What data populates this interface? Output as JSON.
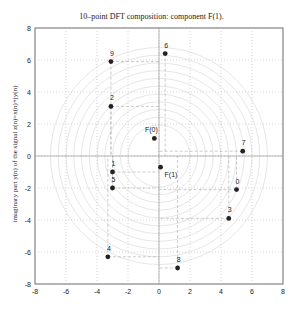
{
  "chart_data": {
    "type": "scatter",
    "title": "10–point DFT composition: component F(1).",
    "xlabel": "",
    "ylabel": "imaginary part y(n) of the signal z(n)=x(n)+jy(n)",
    "xlim": [
      -8,
      8
    ],
    "ylim": [
      -8,
      8
    ],
    "xticks": [
      -8,
      -6,
      -4,
      -2,
      0,
      2,
      4,
      6,
      8
    ],
    "yticks": [
      -8,
      -6,
      -4,
      -2,
      0,
      2,
      4,
      6,
      8
    ],
    "grid": true,
    "points": [
      {
        "label": "0",
        "x": 5.0,
        "y": -2.1
      },
      {
        "label": "1",
        "x": -3.0,
        "y": -1.0
      },
      {
        "label": "2",
        "x": -3.1,
        "y": 3.1
      },
      {
        "label": "3",
        "x": 4.5,
        "y": -3.9
      },
      {
        "label": "4",
        "x": -3.3,
        "y": -6.3
      },
      {
        "label": "5",
        "x": -3.0,
        "y": -2.0
      },
      {
        "label": "6",
        "x": 0.4,
        "y": 6.4
      },
      {
        "label": "7",
        "x": 5.4,
        "y": 0.3
      },
      {
        "label": "8",
        "x": 1.2,
        "y": -7.0
      },
      {
        "label": "9",
        "x": -3.1,
        "y": 5.9
      },
      {
        "label": "F(0)",
        "x": -0.3,
        "y": 1.1
      },
      {
        "label": "F(1)",
        "x": 0.1,
        "y": -0.7
      }
    ]
  }
}
